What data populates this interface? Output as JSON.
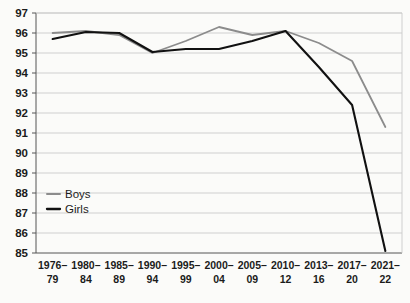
{
  "chart_data": {
    "type": "line",
    "title": "",
    "subtitle": "",
    "xlabel": "",
    "ylabel": "",
    "categories": [
      "1976–\n79",
      "1980–\n84",
      "1985–\n89",
      "1990–\n94",
      "1995–\n99",
      "2000–\n04",
      "2005–\n09",
      "2010–\n12",
      "2013–\n16",
      "2017–\n20",
      "2021–\n22"
    ],
    "category_lines": [
      [
        "1976–",
        "79"
      ],
      [
        "1980–",
        "84"
      ],
      [
        "1985–",
        "89"
      ],
      [
        "1990–",
        "94"
      ],
      [
        "1995–",
        "99"
      ],
      [
        "2000–",
        "04"
      ],
      [
        "2005–",
        "09"
      ],
      [
        "2010–",
        "12"
      ],
      [
        "2013–",
        "16"
      ],
      [
        "2017–",
        "20"
      ],
      [
        "2021–",
        "22"
      ]
    ],
    "series": [
      {
        "name": "Boys",
        "color": "#8c8c8c",
        "values": [
          96.0,
          96.1,
          95.9,
          95.0,
          95.6,
          96.3,
          95.9,
          96.1,
          95.5,
          94.6,
          91.3
        ]
      },
      {
        "name": "Girls",
        "color": "#111111",
        "values": [
          95.7,
          96.05,
          96.0,
          95.05,
          95.2,
          95.2,
          95.6,
          96.1,
          94.3,
          92.4,
          85.1
        ]
      }
    ],
    "ylim": [
      85,
      97
    ],
    "ytick_step": 1,
    "ytick_labels": [
      "97",
      "96",
      "95",
      "94",
      "93",
      "92",
      "91",
      "90",
      "89",
      "88",
      "87",
      "86",
      "85"
    ],
    "grid": true,
    "legend_position": "inside-bottom-left",
    "legend_entries": [
      {
        "label": "Boys",
        "color": "#8c8c8c"
      },
      {
        "label": "Girls",
        "color": "#111111"
      }
    ]
  }
}
